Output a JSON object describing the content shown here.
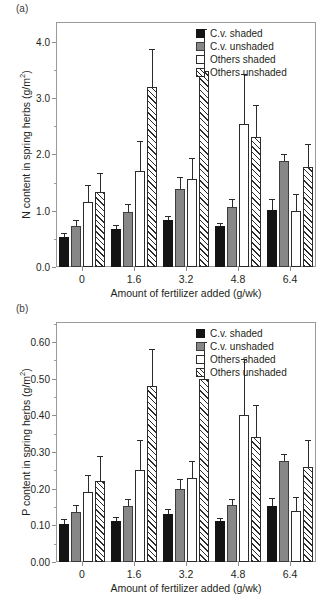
{
  "figure": {
    "panel_a_label": "(a)",
    "panel_b_label": "(b)"
  },
  "legend": {
    "items": [
      {
        "label": "C.v. shaded",
        "style": "s-black",
        "color": "#141414"
      },
      {
        "label": "C.v. unshaded",
        "style": "s-gray",
        "color": "#878787"
      },
      {
        "label": "Others shaded",
        "style": "s-white",
        "color": "#ffffff"
      },
      {
        "label": "Others unshaded",
        "style": "s-hatch",
        "color": "#ffffff"
      }
    ]
  },
  "chart_data": [
    {
      "type": "bar",
      "panel": "(a)",
      "title": "",
      "xlabel": "Amount of fertilizer added (g/wk)",
      "ylabel": "N content in spring herbs (g/m²)",
      "ylabel_main": "N content in spring herbs (g/m",
      "ylabel_sup": "2",
      "ylabel_tail": ")",
      "categories": [
        "0",
        "1.6",
        "3.2",
        "4.8",
        "6.4"
      ],
      "ylim": [
        0.0,
        4.35
      ],
      "yticks": [
        0.0,
        1.0,
        2.0,
        3.0,
        4.0
      ],
      "ytick_labels": [
        "0.0",
        "1.0",
        "2.0",
        "3.0",
        "4.0"
      ],
      "yticks_minor": [
        0.5,
        1.5,
        2.5,
        3.5
      ],
      "grid": false,
      "legend_position": "top-right",
      "series": [
        {
          "name": "C.v. shaded",
          "style": "s-black",
          "values": [
            0.54,
            0.67,
            0.83,
            0.72,
            1.02
          ],
          "errors": [
            0.07,
            0.08,
            0.08,
            0.07,
            0.19
          ]
        },
        {
          "name": "C.v. unshaded",
          "style": "s-gray",
          "values": [
            0.73,
            0.97,
            1.39,
            1.06,
            1.88
          ],
          "errors": [
            0.11,
            0.14,
            0.21,
            0.15,
            0.13
          ]
        },
        {
          "name": "Others shaded",
          "style": "s-white",
          "values": [
            1.15,
            1.71,
            1.57,
            2.54,
            1.0
          ],
          "errors": [
            0.3,
            0.53,
            0.37,
            0.88,
            0.29
          ]
        },
        {
          "name": "Others unshaded",
          "style": "s-hatch",
          "values": [
            1.33,
            3.2,
            3.48,
            2.3,
            1.78
          ],
          "errors": [
            0.34,
            0.67,
            0.74,
            0.58,
            0.41
          ]
        }
      ]
    },
    {
      "type": "bar",
      "panel": "(b)",
      "title": "",
      "xlabel": "Amount of fertilizer added (g/wk)",
      "ylabel": "P content in spring herbs (g/m²)",
      "ylabel_main": "P content in spring herbs (g/m",
      "ylabel_sup": "2",
      "ylabel_tail": ")",
      "categories": [
        "0",
        "1.6",
        "3.2",
        "4.8",
        "6.4"
      ],
      "ylim": [
        0.0,
        0.655
      ],
      "yticks": [
        0.0,
        0.1,
        0.2,
        0.3,
        0.4,
        0.5,
        0.6
      ],
      "ytick_labels": [
        "0.00",
        "0.10",
        "0.20",
        "0.30",
        "0.40",
        "0.50",
        "0.60"
      ],
      "yticks_minor": [
        0.05,
        0.15,
        0.25,
        0.35,
        0.45,
        0.55,
        0.65
      ],
      "grid": false,
      "legend_position": "top-right",
      "series": [
        {
          "name": "C.v. shaded",
          "style": "s-black",
          "values": [
            0.105,
            0.112,
            0.131,
            0.112,
            0.153
          ],
          "errors": [
            0.012,
            0.011,
            0.014,
            0.009,
            0.021
          ]
        },
        {
          "name": "C.v. unshaded",
          "style": "s-gray",
          "values": [
            0.137,
            0.152,
            0.2,
            0.155,
            0.275
          ],
          "errors": [
            0.019,
            0.019,
            0.026,
            0.016,
            0.019
          ]
        },
        {
          "name": "Others shaded",
          "style": "s-white",
          "values": [
            0.19,
            0.251,
            0.23,
            0.4,
            0.14
          ],
          "errors": [
            0.047,
            0.082,
            0.047,
            0.155,
            0.037
          ]
        },
        {
          "name": "Others unshaded",
          "style": "s-hatch",
          "values": [
            0.22,
            0.48,
            0.5,
            0.34,
            0.26
          ],
          "errors": [
            0.068,
            0.1,
            0.1,
            0.089,
            0.073
          ]
        }
      ]
    }
  ]
}
